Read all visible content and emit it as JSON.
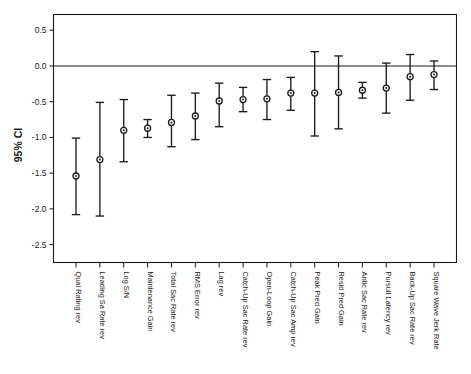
{
  "chart_data": {
    "type": "scatter",
    "title": "",
    "xlabel": "",
    "ylabel": "95% CI",
    "ylim": [
      -2.75,
      0.72
    ],
    "yticks": [
      0.5,
      0.0,
      -0.5,
      -1.0,
      -1.5,
      -2.0,
      -2.5
    ],
    "ytick_labels": [
      "0.5",
      "0.0",
      "-0.5",
      "-1.0",
      "-1.5",
      "-2.0",
      "-2.5"
    ],
    "grid": false,
    "legend": "none",
    "reference_line": 0.0,
    "error_bar_type": "95% CI",
    "categories": [
      "Qual Rating rev",
      "Leading Sa Rate rev",
      "Log S/N",
      "Maintenance Gain",
      "Total Sac Rate rev",
      "RMS Error rev",
      "Lag rev",
      "Catch-Up Sac Rate rev",
      "Open-Loop Gain",
      "Catch-Up Sac Amp rev",
      "Peak Pred Gain",
      "Resid Pred Gain",
      "Antic Sac Rate rev",
      "Pursuit Latency rev",
      "Back-Up Sac Rate rev",
      "Square Wave Jerk Rate"
    ],
    "values": [
      -1.54,
      -1.31,
      -0.9,
      -0.87,
      -0.79,
      -0.7,
      -0.49,
      -0.47,
      -0.46,
      -0.38,
      -0.38,
      -0.37,
      -0.34,
      -0.31,
      -0.15,
      -0.12
    ],
    "ci_lower": [
      -2.08,
      -2.1,
      -1.34,
      -1.0,
      -1.13,
      -1.03,
      -0.85,
      -0.64,
      -0.75,
      -0.62,
      -0.98,
      -0.88,
      -0.45,
      -0.66,
      -0.48,
      -0.33
    ],
    "ci_upper": [
      -1.01,
      -0.51,
      -0.47,
      -0.75,
      -0.41,
      -0.38,
      -0.24,
      -0.3,
      -0.19,
      -0.16,
      0.2,
      0.14,
      -0.23,
      0.04,
      0.16,
      0.07
    ]
  },
  "caption": ""
}
